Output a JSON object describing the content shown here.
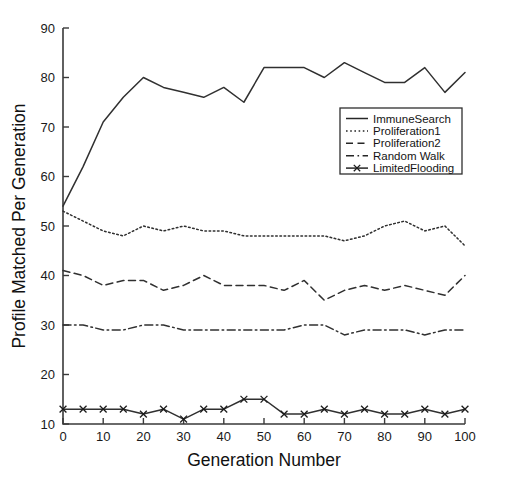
{
  "chart_data": {
    "type": "line",
    "title": "",
    "xlabel": "Generation Number",
    "ylabel": "Profile Matched Per Generation",
    "xlim": [
      0,
      100
    ],
    "ylim": [
      10,
      90
    ],
    "xticks": [
      0,
      10,
      20,
      30,
      40,
      50,
      60,
      70,
      80,
      90,
      100
    ],
    "yticks": [
      10,
      20,
      30,
      40,
      50,
      60,
      70,
      80,
      90
    ],
    "xtick_labels": [
      "0",
      "10",
      "20",
      "30",
      "40",
      "50",
      "60",
      "70",
      "80",
      "90",
      "100"
    ],
    "ytick_labels": [
      "10",
      "20",
      "30",
      "40",
      "50",
      "60",
      "70",
      "80",
      "90"
    ],
    "grid": false,
    "legend_position": "upper right",
    "x": [
      0,
      5,
      10,
      15,
      20,
      25,
      30,
      35,
      40,
      45,
      50,
      55,
      60,
      65,
      70,
      75,
      80,
      85,
      90,
      95,
      100
    ],
    "series": [
      {
        "name": "ImmuneSearch",
        "style": "solid",
        "marker": "none",
        "color": "#303030",
        "values": [
          54,
          62,
          71,
          76,
          80,
          78,
          77,
          76,
          78,
          75,
          82,
          82,
          82,
          80,
          83,
          81,
          79,
          79,
          82,
          77,
          81
        ]
      },
      {
        "name": "Proliferation1",
        "style": "dotted",
        "marker": "none",
        "color": "#303030",
        "values": [
          53,
          51,
          49,
          48,
          50,
          49,
          50,
          49,
          49,
          48,
          48,
          48,
          48,
          48,
          47,
          48,
          50,
          51,
          49,
          50,
          46
        ]
      },
      {
        "name": "Proliferation2",
        "style": "dashed",
        "marker": "none",
        "color": "#303030",
        "values": [
          41,
          40,
          38,
          39,
          39,
          37,
          38,
          40,
          38,
          38,
          38,
          37,
          39,
          35,
          37,
          38,
          37,
          38,
          37,
          36,
          40
        ]
      },
      {
        "name": "Random Walk",
        "style": "dashdot",
        "marker": "none",
        "color": "#303030",
        "values": [
          30,
          30,
          29,
          29,
          30,
          30,
          29,
          29,
          29,
          29,
          29,
          29,
          30,
          30,
          28,
          29,
          29,
          29,
          28,
          29,
          29
        ]
      },
      {
        "name": "LimitedFlooding",
        "style": "solid",
        "marker": "x",
        "color": "#1c1c1c",
        "values": [
          13,
          13,
          13,
          13,
          12,
          13,
          11,
          13,
          13,
          15,
          15,
          12,
          12,
          13,
          12,
          13,
          12,
          12,
          13,
          12,
          13
        ]
      }
    ]
  },
  "legend": {
    "entries": [
      {
        "label": "ImmuneSearch",
        "style": "solid",
        "marker": "none"
      },
      {
        "label": "Proliferation1",
        "style": "dotted",
        "marker": "none"
      },
      {
        "label": "Proliferation2",
        "style": "dashed",
        "marker": "none"
      },
      {
        "label": "Random Walk",
        "style": "dashdot",
        "marker": "none"
      },
      {
        "label": "LimitedFlooding",
        "style": "solid",
        "marker": "x"
      }
    ]
  },
  "colors": {
    "background": "#ffffff",
    "axis": "#3a3a3a",
    "line": "#303030",
    "text": "#1a1a1a"
  }
}
